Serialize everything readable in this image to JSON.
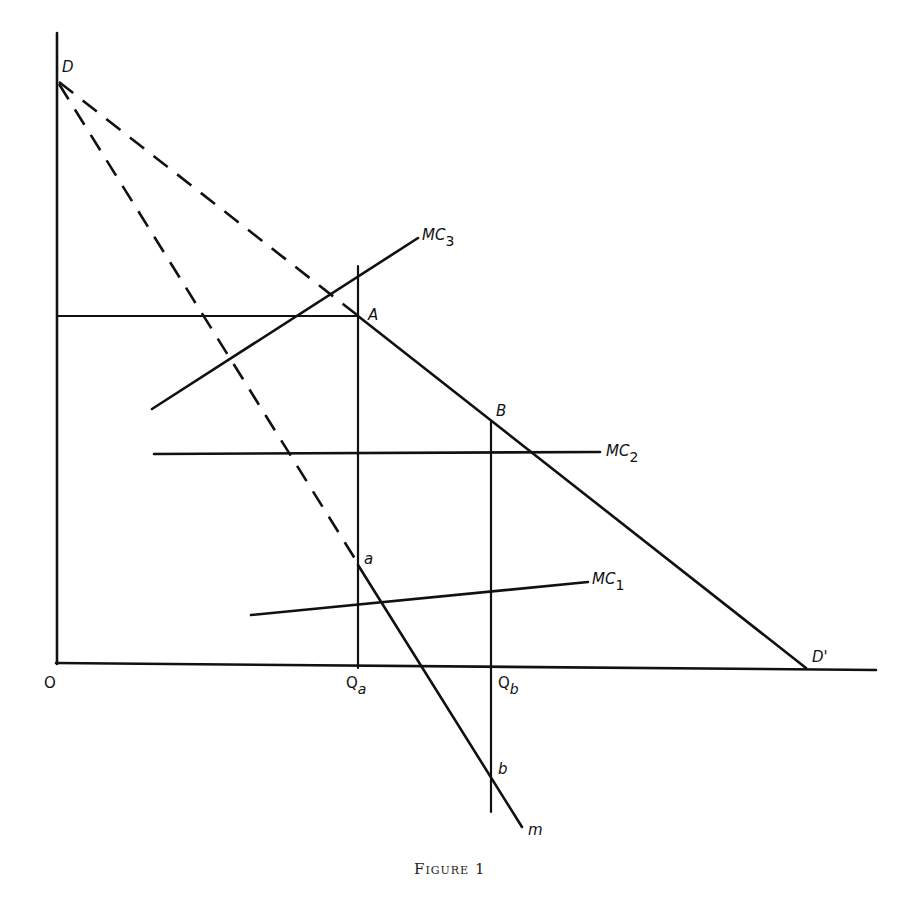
{
  "figure": {
    "caption": "Figure 1",
    "points": {
      "origin": "O",
      "D": "D",
      "D_prime": "D'",
      "A": "A",
      "B": "B",
      "a": "a",
      "b": "b",
      "m": "m"
    },
    "quantities": {
      "Qa_main": "Q",
      "Qa_sub": "a",
      "Qb_main": "Q",
      "Qb_sub": "b"
    },
    "cost_curves": {
      "MC1_main": "MC",
      "MC1_sub": "1",
      "MC2_main": "MC",
      "MC2_sub": "2",
      "MC3_main": "MC",
      "MC3_sub": "3"
    },
    "colors": {
      "ink": "#111111",
      "background": "#ffffff"
    }
  }
}
